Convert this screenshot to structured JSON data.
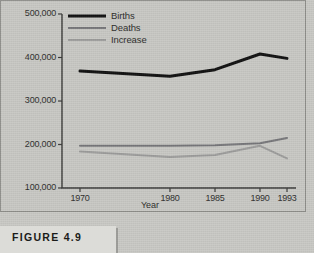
{
  "figure": {
    "caption": "FIGURE 4.9"
  },
  "chart_data": {
    "type": "line",
    "title": "",
    "xlabel": "Year",
    "ylabel": "",
    "categories": [
      "1970",
      "1980",
      "1985",
      "1990",
      "1993"
    ],
    "x": [
      1970,
      1980,
      1985,
      1990,
      1993
    ],
    "xlim": [
      1968,
      1994
    ],
    "ylim": [
      100000,
      500000
    ],
    "ytick_labels": [
      "100,000",
      "200,000",
      "300,000",
      "400,000",
      "500,000"
    ],
    "ytick_values": [
      100000,
      200000,
      300000,
      400000,
      500000
    ],
    "grid": false,
    "legend_position": "top-left-inside",
    "series": [
      {
        "name": "Births",
        "color": "#111111",
        "width": 3.0,
        "values": [
          369000,
          357000,
          372000,
          408000,
          398000
        ]
      },
      {
        "name": "Deaths",
        "color": "#77777a",
        "width": 2.0,
        "values": [
          197000,
          197000,
          198000,
          203000,
          215000
        ]
      },
      {
        "name": "Increase",
        "color": "#9d9d9c",
        "width": 2.0,
        "values": [
          184000,
          171000,
          176000,
          197000,
          168000
        ]
      }
    ]
  },
  "colors": {
    "panel_background": "#c8c8c4",
    "page_background": "#c9c9c5",
    "axis": "#3a3a38",
    "text": "#2e2e2c",
    "figure_box": "#dcdcd8"
  }
}
